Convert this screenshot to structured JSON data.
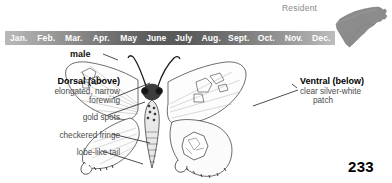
{
  "page": {
    "number": "233",
    "background_color": "#ffffff"
  },
  "status": {
    "residency_label": "Resident",
    "map_name": "north-carolina-state-map",
    "map_fill_color": "#8c8c8c"
  },
  "flight_period": {
    "months": [
      "Jan.",
      "Feb.",
      "Mar.",
      "Apr.",
      "May",
      "June",
      "July",
      "Aug.",
      "Sept.",
      "Oct.",
      "Nov.",
      "Dec."
    ],
    "peak_color": "#5a5a5a",
    "low_color": "#bdbdbd",
    "text_color": "#ffffff"
  },
  "specimen": {
    "sex_label": "male"
  },
  "annotations": {
    "dorsal": {
      "heading": "Dorsal (above)",
      "line1": "elongated, narrow",
      "line2": "forewing"
    },
    "gold_spots": "gold spots",
    "checkered_fringe": "checkered fringe",
    "lobe_like_tail": "lobe-like tail",
    "ventral": {
      "heading": "Ventral (below)",
      "line1": "clear silver-white",
      "line2": "patch"
    }
  }
}
